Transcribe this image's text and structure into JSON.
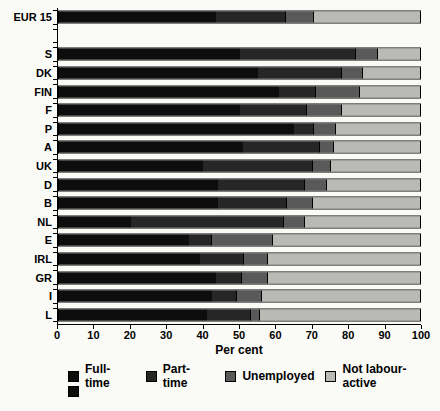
{
  "chart_data": {
    "type": "bar",
    "orientation": "horizontal-stacked",
    "title": "",
    "xlabel": "Per cent",
    "xlim": [
      0,
      100
    ],
    "x_ticks": [
      0,
      10,
      20,
      30,
      40,
      50,
      60,
      70,
      80,
      90,
      100
    ],
    "gap_after_first_category": true,
    "categories": [
      "EUR 15",
      "S",
      "DK",
      "FIN",
      "F",
      "P",
      "A",
      "UK",
      "D",
      "B",
      "NL",
      "E",
      "IRL",
      "GR",
      "I",
      "L"
    ],
    "series": [
      {
        "name": "Full-time",
        "color": "#0d0d0d",
        "values": [
          43.5,
          50,
          55,
          61,
          50,
          65,
          51,
          40,
          44,
          44,
          20,
          36,
          39,
          43.5,
          42.5,
          41
        ]
      },
      {
        "name": "Part-time",
        "color": "#262626",
        "values": [
          19,
          32,
          23,
          10,
          18.5,
          5.5,
          21,
          30,
          24,
          19,
          42,
          6,
          12,
          7,
          6.5,
          12
        ]
      },
      {
        "name": "Unemployed",
        "color": "#595959",
        "values": [
          8,
          6,
          6,
          12,
          9.5,
          6,
          4,
          5,
          6,
          7,
          6,
          17,
          6.5,
          7,
          7,
          2.5
        ]
      },
      {
        "name": "Not labour-active",
        "color": "#b9bab6",
        "values": [
          29.5,
          12,
          16,
          17,
          22,
          23.5,
          24,
          25,
          26,
          30,
          32,
          41,
          42.5,
          42.5,
          44,
          44.5
        ]
      }
    ]
  },
  "legend": {
    "items": [
      {
        "label": "Full-time",
        "color": "#0d0d0d"
      },
      {
        "label": "Part-time",
        "color": "#262626"
      },
      {
        "label": "Unemployed",
        "color": "#595959"
      },
      {
        "label": "Not labour-active",
        "color": "#b9bab6"
      }
    ],
    "extra_unlabeled_swatch_color": "#0d0d0d"
  }
}
